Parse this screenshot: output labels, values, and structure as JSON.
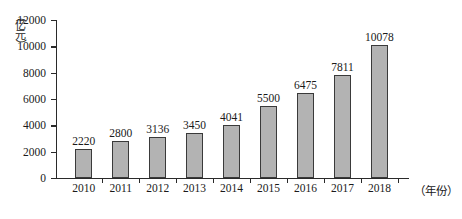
{
  "chart_data": {
    "type": "bar",
    "title": "",
    "xlabel": "（年份）",
    "ylabel": "（亿元）",
    "ylabel_chars": [
      "（",
      "亿",
      "元",
      "）"
    ],
    "categories": [
      "2010",
      "2011",
      "2012",
      "2013",
      "2014",
      "2015",
      "2016",
      "2017",
      "2018"
    ],
    "values": [
      2220,
      2800,
      3136,
      3450,
      4041,
      5500,
      6475,
      7811,
      10078
    ],
    "value_labels": [
      "2220",
      "2800",
      "3136",
      "3450",
      "4041",
      "5500",
      "6475",
      "7811",
      "10078"
    ],
    "ylim": [
      0,
      12000
    ],
    "yticks": [
      0,
      2000,
      4000,
      6000,
      8000,
      10000,
      12000
    ],
    "ytick_labels": [
      "0",
      "2000",
      "4000",
      "6000",
      "8000",
      "10000",
      "12000"
    ],
    "grid": false,
    "legend": null,
    "bar_color": "#b3b3b3",
    "bar_edge_color": "#3a3a3a",
    "axis_color": "#2a2a2a"
  }
}
